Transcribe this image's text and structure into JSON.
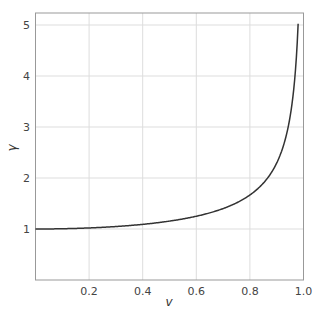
{
  "chart_data": {
    "type": "line",
    "title": "",
    "xlabel": "v",
    "ylabel": "γ",
    "xlim": [
      0.0,
      1.0
    ],
    "ylim": [
      0.0,
      5.33
    ],
    "xticks": [
      0.2,
      0.4,
      0.6,
      0.8,
      1.0
    ],
    "xtick_labels": [
      "0.2",
      "0.4",
      "0.6",
      "0.8",
      "1.0"
    ],
    "yticks": [
      1,
      2,
      3,
      4,
      5
    ],
    "ytick_labels": [
      "1",
      "2",
      "3",
      "4",
      "5"
    ],
    "grid": true,
    "legend": null,
    "series": [
      {
        "name": "gamma(v) = 1/sqrt(1 - v^2)",
        "color": "#333333",
        "x": [
          0.0,
          0.1,
          0.2,
          0.3,
          0.4,
          0.5,
          0.6,
          0.7,
          0.75,
          0.8,
          0.85,
          0.9,
          0.92,
          0.94,
          0.95,
          0.96,
          0.97,
          0.98
        ],
        "y": [
          1.0,
          1.005,
          1.021,
          1.048,
          1.091,
          1.155,
          1.25,
          1.4,
          1.512,
          1.667,
          1.898,
          2.294,
          2.552,
          2.931,
          3.203,
          3.571,
          4.113,
          5.025
        ]
      }
    ]
  },
  "colors": {
    "line": "#333333",
    "grid": "#dddddd",
    "frame": "#999999",
    "text": "#444444"
  }
}
